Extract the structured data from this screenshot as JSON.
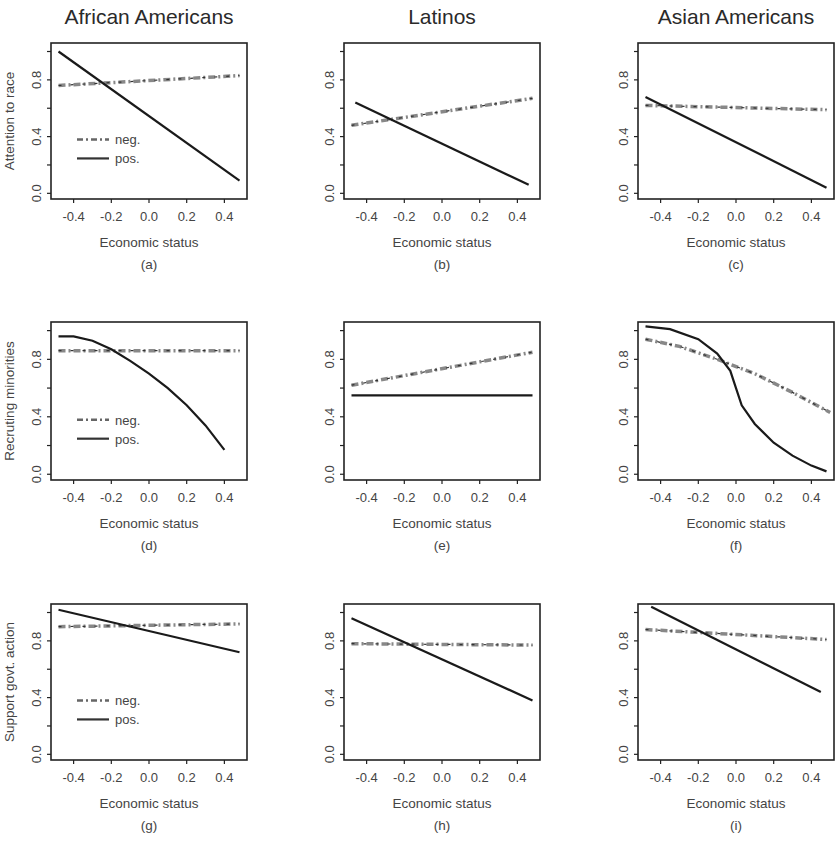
{
  "figure": {
    "column_titles": [
      "African Americans",
      "Latinos",
      "Asian Americans"
    ],
    "row_ylabels": [
      "Attention to race",
      "Recruting minorities",
      "Support govt. action"
    ],
    "xlabel": "Economic status",
    "x_ticks": [
      "-0.4",
      "-0.2",
      "0.0",
      "0.2",
      "0.4"
    ],
    "y_ticks": [
      "0.0",
      "0.4",
      "0.8"
    ],
    "legend": {
      "neg": "neg.",
      "pos": "pos."
    },
    "panel_labels": [
      "(a)",
      "(b)",
      "(c)",
      "(d)",
      "(e)",
      "(f)",
      "(g)",
      "(h)",
      "(i)"
    ]
  },
  "chart_data": [
    {
      "panel": "(a)",
      "type": "line",
      "title": "African Americans",
      "xlabel": "Economic status",
      "ylabel": "Attention to race",
      "xlim": [
        -0.5,
        0.5
      ],
      "ylim": [
        0,
        1
      ],
      "legend": [
        "neg.",
        "pos."
      ],
      "series": [
        {
          "name": "neg.",
          "style": "dash-dot",
          "x": [
            -0.48,
            0.48
          ],
          "y": [
            0.76,
            0.83
          ]
        },
        {
          "name": "pos.",
          "style": "solid",
          "x": [
            -0.48,
            0.48
          ],
          "y": [
            1.0,
            0.09
          ]
        }
      ]
    },
    {
      "panel": "(b)",
      "type": "line",
      "title": "Latinos",
      "xlabel": "Economic status",
      "ylabel": "",
      "xlim": [
        -0.5,
        0.5
      ],
      "ylim": [
        0,
        1
      ],
      "series": [
        {
          "name": "neg.",
          "style": "dash-dot",
          "x": [
            -0.48,
            0.48
          ],
          "y": [
            0.48,
            0.67
          ]
        },
        {
          "name": "pos.",
          "style": "solid",
          "x": [
            -0.46,
            0.46
          ],
          "y": [
            0.64,
            0.06
          ]
        }
      ]
    },
    {
      "panel": "(c)",
      "type": "line",
      "title": "Asian Americans",
      "xlabel": "Economic status",
      "ylabel": "",
      "xlim": [
        -0.5,
        0.5
      ],
      "ylim": [
        0,
        1
      ],
      "series": [
        {
          "name": "neg.",
          "style": "dash-dot",
          "x": [
            -0.48,
            0.48
          ],
          "y": [
            0.62,
            0.59
          ]
        },
        {
          "name": "pos.",
          "style": "solid",
          "x": [
            -0.48,
            0.48
          ],
          "y": [
            0.68,
            0.04
          ]
        }
      ]
    },
    {
      "panel": "(d)",
      "type": "line",
      "xlabel": "Economic status",
      "ylabel": "Recruting minorities",
      "xlim": [
        -0.5,
        0.5
      ],
      "ylim": [
        0,
        1
      ],
      "legend": [
        "neg.",
        "pos."
      ],
      "series": [
        {
          "name": "neg.",
          "style": "dash-dot",
          "x": [
            -0.48,
            0.48
          ],
          "y": [
            0.86,
            0.86
          ]
        },
        {
          "name": "pos.",
          "style": "solid",
          "x": [
            -0.48,
            -0.4,
            -0.3,
            -0.2,
            -0.1,
            0.0,
            0.1,
            0.2,
            0.3,
            0.4
          ],
          "y": [
            0.96,
            0.96,
            0.93,
            0.87,
            0.79,
            0.7,
            0.6,
            0.48,
            0.34,
            0.17
          ]
        }
      ]
    },
    {
      "panel": "(e)",
      "type": "line",
      "xlabel": "Economic status",
      "ylabel": "",
      "xlim": [
        -0.5,
        0.5
      ],
      "ylim": [
        0,
        1
      ],
      "series": [
        {
          "name": "neg.",
          "style": "dash-dot",
          "x": [
            -0.48,
            0.48
          ],
          "y": [
            0.62,
            0.85
          ]
        },
        {
          "name": "pos.",
          "style": "solid",
          "x": [
            -0.48,
            0.48
          ],
          "y": [
            0.55,
            0.55
          ]
        }
      ]
    },
    {
      "panel": "(f)",
      "type": "line",
      "xlabel": "Economic status",
      "ylabel": "",
      "xlim": [
        -0.5,
        0.5
      ],
      "ylim": [
        0,
        1
      ],
      "series": [
        {
          "name": "neg.",
          "style": "dash-dot",
          "x": [
            -0.48,
            -0.3,
            -0.1,
            0.1,
            0.3,
            0.5
          ],
          "y": [
            0.94,
            0.89,
            0.8,
            0.7,
            0.57,
            0.43
          ]
        },
        {
          "name": "pos.",
          "style": "solid",
          "x": [
            -0.48,
            -0.35,
            -0.2,
            -0.1,
            -0.03,
            0.0,
            0.03,
            0.1,
            0.2,
            0.3,
            0.4,
            0.48
          ],
          "y": [
            1.03,
            1.01,
            0.94,
            0.84,
            0.72,
            0.6,
            0.48,
            0.35,
            0.22,
            0.13,
            0.06,
            0.02
          ]
        }
      ]
    },
    {
      "panel": "(g)",
      "type": "line",
      "xlabel": "Economic status",
      "ylabel": "Support govt. action",
      "xlim": [
        -0.5,
        0.5
      ],
      "ylim": [
        0,
        1
      ],
      "legend": [
        "neg.",
        "pos."
      ],
      "series": [
        {
          "name": "neg.",
          "style": "dash-dot",
          "x": [
            -0.48,
            0.48
          ],
          "y": [
            0.9,
            0.92
          ]
        },
        {
          "name": "pos.",
          "style": "solid",
          "x": [
            -0.48,
            0.48
          ],
          "y": [
            1.02,
            0.72
          ]
        }
      ]
    },
    {
      "panel": "(h)",
      "type": "line",
      "xlabel": "Economic status",
      "ylabel": "",
      "xlim": [
        -0.5,
        0.5
      ],
      "ylim": [
        0,
        1
      ],
      "series": [
        {
          "name": "neg.",
          "style": "dash-dot",
          "x": [
            -0.48,
            0.48
          ],
          "y": [
            0.78,
            0.77
          ]
        },
        {
          "name": "pos.",
          "style": "solid",
          "x": [
            -0.48,
            0.48
          ],
          "y": [
            0.96,
            0.38
          ]
        }
      ]
    },
    {
      "panel": "(i)",
      "type": "line",
      "xlabel": "Economic status",
      "ylabel": "",
      "xlim": [
        -0.5,
        0.5
      ],
      "ylim": [
        0,
        1
      ],
      "series": [
        {
          "name": "neg.",
          "style": "dash-dot",
          "x": [
            -0.48,
            0.48
          ],
          "y": [
            0.88,
            0.81
          ]
        },
        {
          "name": "pos.",
          "style": "solid",
          "x": [
            -0.45,
            0.45
          ],
          "y": [
            1.04,
            0.44
          ]
        }
      ]
    }
  ]
}
